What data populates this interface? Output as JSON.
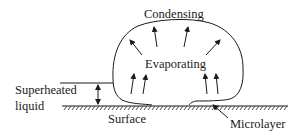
{
  "diagram": {
    "type": "bubble-boiling-schematic",
    "labels": {
      "condensing": "Condensing",
      "evaporating": "Evaporating",
      "superheated_line1": "Superheated",
      "superheated_line2": "liquid",
      "surface": "Surface",
      "microlayer": "Microlayer"
    },
    "colors": {
      "stroke": "#1a1a1a",
      "background": "#ffffff"
    }
  }
}
